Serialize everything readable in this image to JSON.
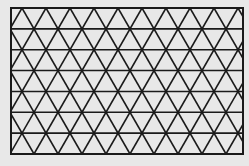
{
  "figure": {
    "background": "#e8e8e8",
    "line_color": "#1a1a1a",
    "border": {
      "x0": 11,
      "y0": 8,
      "x1": 243,
      "y1": 154
    },
    "rows": 7,
    "triangle_width": 24,
    "first_top_apex_x": 22,
    "stroke_width": 1.6,
    "border_stroke_width": 2
  }
}
